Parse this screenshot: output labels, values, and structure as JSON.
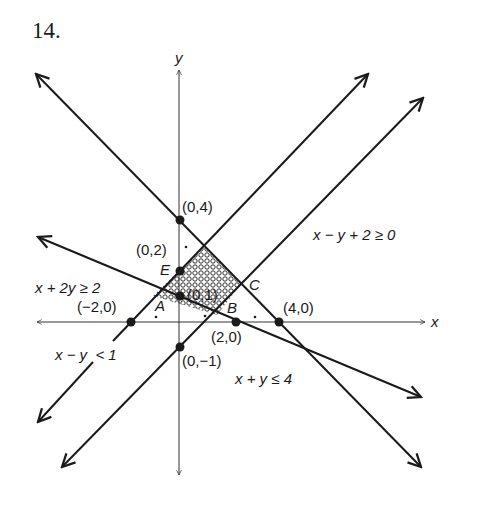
{
  "problem_number": "14.",
  "axes": {
    "x_label": "x",
    "y_label": "y"
  },
  "points": {
    "p04": "(0,4)",
    "p02": "(0,2)",
    "p01": "(0,1)",
    "pm20": "(−2,0)",
    "p20": "(2,0)",
    "p40": "(4,0)",
    "p0m1": "(0,−1)"
  },
  "vertices": {
    "A": "A",
    "B": "B",
    "C": "C",
    "E": "E"
  },
  "inequalities": {
    "ineq1": "x − y + 2 ≥ 0",
    "ineq2": "x + 2y ≥ 2",
    "ineq3": "x − y  < 1",
    "ineq4": "x + y ≤ 4"
  },
  "colors": {
    "line": "#1a1a1a",
    "axis": "#333333",
    "background": "#ffffff"
  }
}
